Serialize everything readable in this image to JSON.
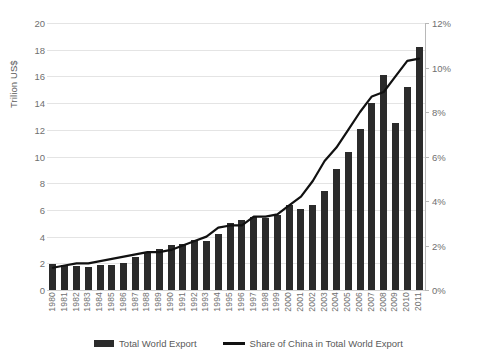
{
  "chart_data": {
    "type": "bar",
    "title": "",
    "subtitle": "",
    "xlabel": "",
    "ylabel": "Trilion US$",
    "y2label": "",
    "grid": true,
    "legend_position": "bottom",
    "categories": [
      "1980",
      "1981",
      "1982",
      "1983",
      "1984",
      "1985",
      "1986",
      "1987",
      "1988",
      "1989",
      "1990",
      "1991",
      "1992",
      "1993",
      "1994",
      "1995",
      "1996",
      "1997",
      "1998",
      "1999",
      "2000",
      "2001",
      "2002",
      "2003",
      "2004",
      "2005",
      "2006",
      "2007",
      "2008",
      "2009",
      "2010",
      "2011"
    ],
    "ylim": [
      0,
      20
    ],
    "yticks": [
      0,
      2,
      4,
      6,
      8,
      10,
      12,
      14,
      16,
      18,
      20
    ],
    "ytick_labels": [
      "0",
      "2",
      "4",
      "6",
      "8",
      "10",
      "12",
      "14",
      "16",
      "18",
      "20"
    ],
    "y2lim": [
      0,
      12
    ],
    "y2ticks": [
      0,
      2,
      4,
      6,
      8,
      10,
      12
    ],
    "y2tick_labels": [
      "0%",
      "2%",
      "4%",
      "6%",
      "8%",
      "10%",
      "12%"
    ],
    "series": [
      {
        "name": "Total World Export",
        "type": "bar",
        "axis": "left",
        "unit": "Trillion US$",
        "color": "#2b2b2b",
        "values": [
          1.95,
          1.9,
          1.8,
          1.75,
          1.85,
          1.9,
          2.05,
          2.45,
          2.8,
          3.05,
          3.4,
          3.45,
          3.75,
          3.7,
          4.2,
          5.0,
          5.25,
          5.45,
          5.4,
          5.6,
          6.35,
          6.1,
          6.4,
          7.4,
          9.1,
          10.35,
          12.05,
          14.0,
          16.1,
          12.5,
          15.2,
          18.2
        ]
      },
      {
        "name": "Share of China in Total World Export",
        "type": "line",
        "axis": "right",
        "unit": "%",
        "color": "#111111",
        "values": [
          1.0,
          1.1,
          1.2,
          1.2,
          1.3,
          1.4,
          1.5,
          1.6,
          1.7,
          1.7,
          1.8,
          2.0,
          2.2,
          2.4,
          2.8,
          2.9,
          2.9,
          3.3,
          3.3,
          3.4,
          3.8,
          4.2,
          4.9,
          5.8,
          6.4,
          7.2,
          8.0,
          8.7,
          8.9,
          9.6,
          10.3,
          10.4
        ]
      }
    ]
  },
  "legend": {
    "items": [
      {
        "label": "Total World Export",
        "marker": "bar-swatch"
      },
      {
        "label": "Share of China in Total World Export",
        "marker": "line-swatch"
      }
    ]
  }
}
